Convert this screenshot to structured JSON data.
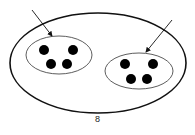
{
  "diagram": {
    "caption": "8",
    "outer_set": {
      "cx": 98,
      "cy": 63,
      "rx": 88,
      "ry": 50
    },
    "groups": [
      {
        "name": "left-group",
        "ellipse": {
          "cx": 59,
          "cy": 55,
          "rx": 33,
          "ry": 19
        },
        "dots": [
          [
            44,
            50
          ],
          [
            73,
            50
          ],
          [
            51,
            64
          ],
          [
            67,
            64
          ]
        ],
        "arrow": {
          "x1": 32,
          "y1": 10,
          "x2": 52,
          "y2": 36
        }
      },
      {
        "name": "right-group",
        "ellipse": {
          "cx": 139,
          "cy": 71,
          "rx": 34,
          "ry": 18
        },
        "dots": [
          [
            125,
            64
          ],
          [
            153,
            64
          ],
          [
            131,
            79
          ],
          [
            147,
            79
          ]
        ],
        "arrow": {
          "x1": 172,
          "y1": 20,
          "x2": 146,
          "y2": 52
        }
      }
    ],
    "colors": {
      "stroke": "#111111",
      "dot": "#000000",
      "background": "#ffffff"
    }
  }
}
